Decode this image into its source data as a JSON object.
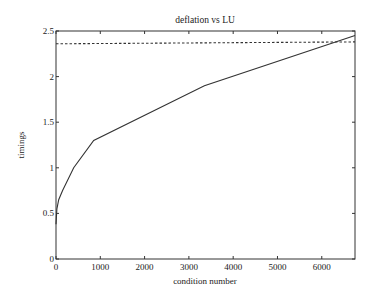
{
  "chart_data": {
    "type": "line",
    "title": "deflation vs LU",
    "xlabel": "condition number",
    "ylabel": "timings",
    "xlim": [
      0,
      6750
    ],
    "ylim": [
      0,
      2.5
    ],
    "xticks": [
      "0",
      "1000",
      "2000",
      "3000",
      "4000",
      "5000",
      "6000"
    ],
    "yticks": [
      "0",
      "0.5",
      "1",
      "1.5",
      "2",
      "2.5"
    ],
    "grid": false,
    "legend": null,
    "series": [
      {
        "name": "deflation",
        "style": "solid",
        "x": [
          0,
          20,
          60,
          150,
          400,
          850,
          3350,
          6750
        ],
        "y": [
          0.38,
          0.55,
          0.65,
          0.75,
          1.0,
          1.3,
          1.9,
          2.45
        ]
      },
      {
        "name": "LU",
        "style": "dashed",
        "x": [
          0,
          6750
        ],
        "y": [
          2.36,
          2.38
        ]
      }
    ]
  }
}
